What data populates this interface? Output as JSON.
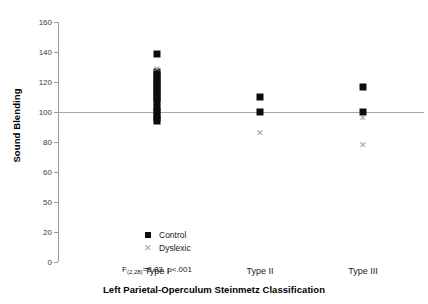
{
  "chart_data": {
    "type": "scatter",
    "title": "",
    "xlabel": "Left Parietal-Operculum Steinmetz Classification",
    "ylabel": "Sound Blending",
    "categories": [
      "Type I",
      "Type II",
      "Type III"
    ],
    "ylim": [
      0,
      160
    ],
    "yticks": [
      0,
      20,
      40,
      60,
      80,
      100,
      120,
      140,
      160
    ],
    "ytick_labels": [
      "0",
      "20",
      "50",
      "60",
      "80",
      "100",
      "120",
      "140",
      "160"
    ],
    "grid": false,
    "legend_position": "inside-lower-left",
    "reference_line": {
      "y": 100,
      "color": "#a8a8a8"
    },
    "annotation": {
      "f_label": "F",
      "df": "(2,28)",
      "equals": "=8.83, p<.001"
    },
    "series": [
      {
        "name": "Control",
        "marker": "square",
        "color": "#0d0d0d",
        "points": [
          {
            "category": "Type I",
            "y": 139
          },
          {
            "category": "Type I",
            "y": 127
          },
          {
            "category": "Type I",
            "y": 125
          },
          {
            "category": "Type I",
            "y": 123
          },
          {
            "category": "Type I",
            "y": 121
          },
          {
            "category": "Type I",
            "y": 119
          },
          {
            "category": "Type I",
            "y": 117
          },
          {
            "category": "Type I",
            "y": 115
          },
          {
            "category": "Type I",
            "y": 113
          },
          {
            "category": "Type I",
            "y": 111
          },
          {
            "category": "Type I",
            "y": 109
          },
          {
            "category": "Type I",
            "y": 107
          },
          {
            "category": "Type I",
            "y": 103
          },
          {
            "category": "Type I",
            "y": 101
          },
          {
            "category": "Type I",
            "y": 98
          },
          {
            "category": "Type I",
            "y": 96
          },
          {
            "category": "Type I",
            "y": 94
          },
          {
            "category": "Type II",
            "y": 110
          },
          {
            "category": "Type II",
            "y": 100
          },
          {
            "category": "Type III",
            "y": 117
          },
          {
            "category": "Type III",
            "y": 100
          }
        ]
      },
      {
        "name": "Dyslexic",
        "marker": "x",
        "color": "#9b9b9b",
        "points": [
          {
            "category": "Type I",
            "y": 129
          },
          {
            "category": "Type II",
            "y": 86
          },
          {
            "category": "Type III",
            "y": 96
          },
          {
            "category": "Type III",
            "y": 78
          }
        ]
      }
    ]
  },
  "legend": {
    "items": [
      {
        "label": "Control",
        "marker": "square"
      },
      {
        "label": "Dyslexic",
        "marker": "x"
      }
    ]
  },
  "icons": {
    "x_marker": "✕"
  }
}
